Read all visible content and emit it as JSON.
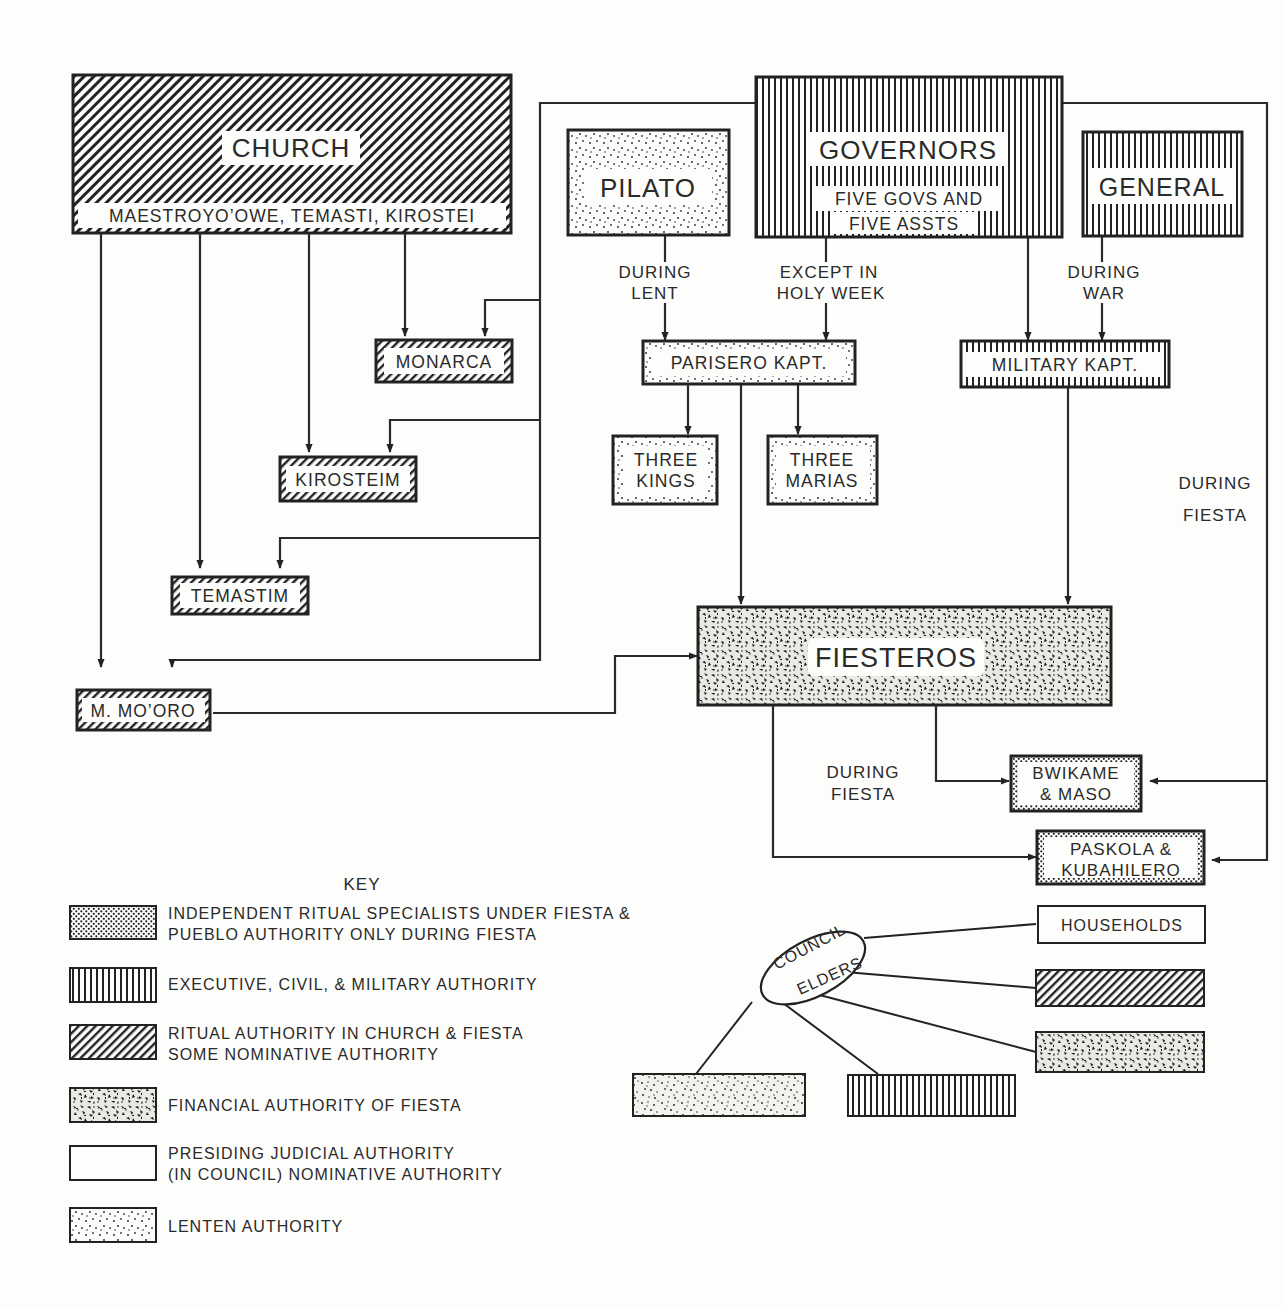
{
  "diagram": {
    "nodes": {
      "church": {
        "title": "CHURCH",
        "subtitle": "MAESTROYO’OWE, TEMASTI, KIROSTEI",
        "pattern": "diagonal-hatch"
      },
      "governors": {
        "title": "GOVERNORS",
        "subtitle_line1": "FIVE GOVS AND",
        "subtitle_line2": "FIVE ASSTS",
        "pattern": "vertical-lines"
      },
      "pilato": {
        "title": "PILATO",
        "pattern": "light-dots"
      },
      "general": {
        "title": "GENERAL",
        "pattern": "vertical-lines"
      },
      "monarca": {
        "title": "MONARCA",
        "pattern": "diagonal-hatch"
      },
      "kirosteim": {
        "title": "KIROSTEIM",
        "pattern": "diagonal-hatch"
      },
      "temastim": {
        "title": "TEMASTIM",
        "pattern": "diagonal-hatch"
      },
      "m_mooro": {
        "title": "M. MO’ORO",
        "pattern": "diagonal-hatch"
      },
      "parisero": {
        "title": "PARISERO KAPT.",
        "pattern": "light-dots"
      },
      "military": {
        "title": "MILITARY KAPT.",
        "pattern": "vertical-lines"
      },
      "three_kings": {
        "line1": "THREE",
        "line2": "KINGS",
        "pattern": "light-dots"
      },
      "three_marias": {
        "line1": "THREE",
        "line2": "MARIAS",
        "pattern": "light-dots"
      },
      "fiesteros": {
        "title": "FIESTEROS",
        "pattern": "heavy-speckle"
      },
      "bwikame": {
        "line1": "BWIKAME",
        "line2": "& MASO",
        "pattern": "checker-dots"
      },
      "paskola": {
        "line1": "PASKOLA &",
        "line2": "KUBAHILERO",
        "pattern": "checker-dots"
      }
    },
    "edge_labels": {
      "during_lent": [
        "DURING",
        "LENT"
      ],
      "except_holy_week": [
        "EXCEPT IN",
        "HOLY WEEK"
      ],
      "during_war": [
        "DURING",
        "WAR"
      ],
      "during_fiesta_right": [
        "DURING",
        "FIESTA"
      ],
      "during_fiesta_bottom": [
        "DURING",
        "FIESTA"
      ]
    },
    "council": {
      "line1": "COUNCIL",
      "line2": "ELDERS",
      "households": "HOUSEHOLDS"
    }
  },
  "key": {
    "title": "KEY",
    "items": [
      {
        "pattern": "checker-dots",
        "line1": "INDEPENDENT RITUAL SPECIALISTS UNDER FIESTA &",
        "line2": "PUEBLO AUTHORITY ONLY DURING FIESTA"
      },
      {
        "pattern": "vertical-lines",
        "line1": "EXECUTIVE, CIVIL, & MILITARY AUTHORITY",
        "line2": ""
      },
      {
        "pattern": "diagonal-hatch",
        "line1": "RITUAL AUTHORITY IN CHURCH & FIESTA",
        "line2": "SOME NOMINATIVE AUTHORITY"
      },
      {
        "pattern": "heavy-speckle",
        "line1": "FINANCIAL AUTHORITY OF FIESTA",
        "line2": ""
      },
      {
        "pattern": "blank",
        "line1": "PRESIDING JUDICIAL AUTHORITY",
        "line2": "(IN COUNCIL) NOMINATIVE AUTHORITY"
      },
      {
        "pattern": "light-dots",
        "line1": "LENTEN AUTHORITY",
        "line2": ""
      }
    ]
  },
  "colors": {
    "ink": "#222222",
    "paper": "#fdfdfb"
  }
}
